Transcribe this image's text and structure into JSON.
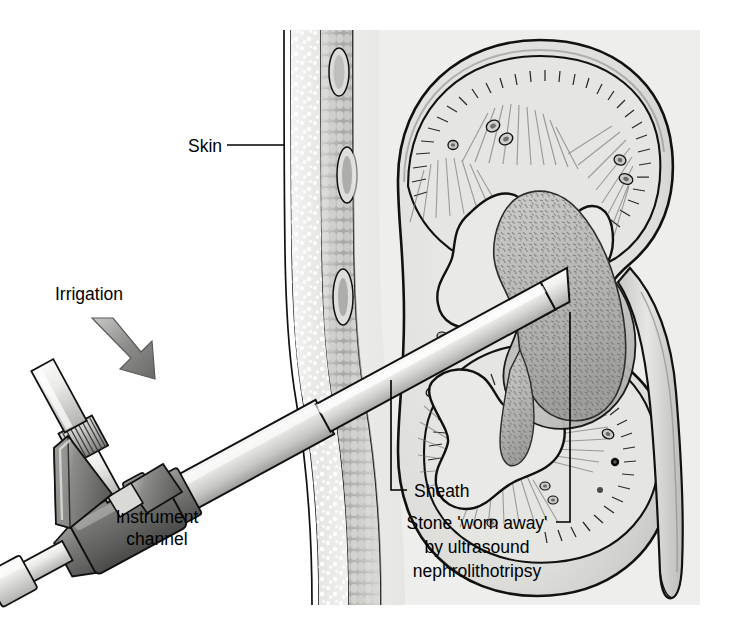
{
  "figure": {
    "background_color": "#ffffff",
    "width": 731,
    "height": 635
  },
  "labels": {
    "skin": "Skin",
    "irrigation": "Irrigation",
    "instrument_channel_line1": "Instrument",
    "instrument_channel_line2": "channel",
    "sheath": "Sheath",
    "stone_line1": "Stone 'worn away'",
    "stone_line2": "by ultrasound",
    "stone_line3": "nephrolithotripsy"
  },
  "anatomy": {
    "kidney": "kidney-cross-section",
    "cortex": "renal-cortex",
    "pyramids": "medullary-pyramids",
    "calyces": "renal-calyces",
    "pelvis": "renal-pelvis",
    "ureter": "ureter",
    "stone": "staghorn-calculus",
    "skin_layer": "epidermis",
    "fat_layer": "subcutaneous-fat",
    "muscle_layer": "muscle"
  },
  "instrument": {
    "eyepiece": "nephroscope-eyepiece",
    "irrigation_port": "irrigation-port",
    "body": "nephroscope-body",
    "shaft": "nephroscope-shaft",
    "sheath": "access-sheath",
    "channel_port": "instrument-channel-port",
    "arrow": "irrigation-flow-arrow"
  },
  "colors": {
    "ink": "#111111",
    "tissue_light": "#e8e8e6",
    "tissue_mid": "#cfcfcc",
    "tissue_dark": "#a9a9a6",
    "stone": "#bdbdba",
    "metal_light": "#e4e4e2",
    "metal_mid": "#b4b4b2",
    "metal_dark": "#6a6a6a",
    "arrow": "#8a8a8a",
    "background": "#ffffff"
  }
}
